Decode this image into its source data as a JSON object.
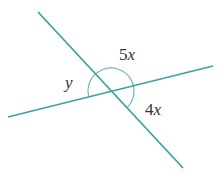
{
  "diagram": {
    "line_color": "#3aa3a3",
    "arc_color": "#6bb8b8",
    "labels": {
      "top_angle": {
        "coef": "5",
        "var": "x"
      },
      "right_angle": {
        "coef": "4",
        "var": "x"
      },
      "left_angle": {
        "coef": "",
        "var": "y"
      }
    }
  }
}
